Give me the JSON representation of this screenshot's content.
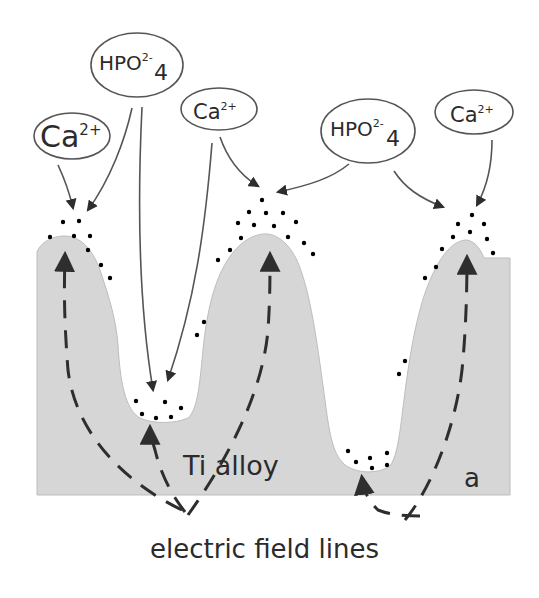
{
  "figure": {
    "panel_label": "a",
    "substrate_label": "Ti alloy",
    "caption_label": "electric field lines",
    "colors": {
      "background": "#ffffff",
      "substrate_fill": "#d6d6d6",
      "line": "#555555",
      "text": "#2b2b2b",
      "deposit": "#333333"
    }
  },
  "ions": [
    {
      "id": "ca-left",
      "base": "Ca",
      "sup": "2+",
      "sub": ""
    },
    {
      "id": "hpo4-left",
      "base": "HPO",
      "sup": "2-",
      "sub": "4"
    },
    {
      "id": "ca-middle",
      "base": "Ca",
      "sup": "2+",
      "sub": ""
    },
    {
      "id": "hpo4-right",
      "base": "HPO",
      "sup": "2-",
      "sub": "4"
    },
    {
      "id": "ca-right",
      "base": "Ca",
      "sup": "2+",
      "sub": ""
    }
  ],
  "legend": {
    "deposit_symbol": "calcium phosphate deposit (asterisk)",
    "dashed_arrow": "electric field line",
    "solid_arrow": "ion migration path"
  }
}
